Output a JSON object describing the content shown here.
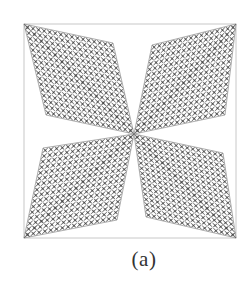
{
  "figure": {
    "caption": "(a)",
    "outer_square": {
      "x1": 24,
      "y1": 24,
      "x2": 236,
      "y2": 238
    },
    "center": [
      134,
      134
    ],
    "colors": {
      "background": "#ffffff",
      "outer_border": "#c8c8c8",
      "blade_outline": "#9a9a9a",
      "fractal_fill": "#4a4a4a",
      "caption": "#333333"
    },
    "blades": [
      {
        "name": "top-left",
        "corner": [
          24,
          24
        ],
        "side_a": [
          113,
          43
        ],
        "side_b": [
          46,
          115
        ]
      },
      {
        "name": "top-right",
        "corner": [
          236,
          24
        ],
        "side_a": [
          152,
          45
        ],
        "side_b": [
          225,
          115
        ]
      },
      {
        "name": "bottom-right",
        "corner": [
          236,
          238
        ],
        "side_a": [
          223,
          153
        ],
        "side_b": [
          146,
          217
        ]
      },
      {
        "name": "bottom-left",
        "corner": [
          24,
          238
        ],
        "side_a": [
          43,
          148
        ],
        "side_b": [
          117,
          220
        ]
      }
    ],
    "fractal_depth": 3
  }
}
